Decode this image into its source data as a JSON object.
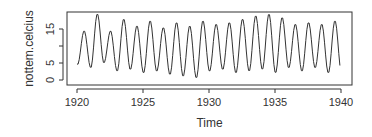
{
  "chart_data": {
    "type": "line",
    "title": "",
    "xlabel": "Time",
    "ylabel": "nottem.celcius",
    "xlim": [
      1919.5,
      1940.3
    ],
    "ylim": [
      -0.8,
      21.5
    ],
    "x_ticks": [
      1920,
      1925,
      1930,
      1935,
      1940
    ],
    "x_tick_labels": [
      "1920",
      "1925",
      "1930",
      "1935",
      "1940"
    ],
    "y_ticks": [
      0,
      5,
      10,
      15
    ],
    "y_tick_labels": [
      "0",
      "5",
      "10",
      "15"
    ],
    "grid": false,
    "legend": null,
    "line_color": "#333333",
    "series_note": "Approximate seasonal extrema read from the rendered line; not exact monthly values. The plotted polyline is a smooth seasonal interpolation of these extrema, not the original monthly series.",
    "annual_extrema_approx": [
      {
        "year": 1920,
        "peak": 14.5,
        "trough": 4.5
      },
      {
        "year": 1921,
        "peak": 19.5,
        "trough": 3.5
      },
      {
        "year": 1922,
        "peak": 14.5,
        "trough": 5.0
      },
      {
        "year": 1923,
        "peak": 18.0,
        "trough": 2.5
      },
      {
        "year": 1924,
        "peak": 16.0,
        "trough": 3.0
      },
      {
        "year": 1925,
        "peak": 17.5,
        "trough": 2.0
      },
      {
        "year": 1926,
        "peak": 15.5,
        "trough": 2.5
      },
      {
        "year": 1927,
        "peak": 17.0,
        "trough": 1.5
      },
      {
        "year": 1928,
        "peak": 16.0,
        "trough": 1.0
      },
      {
        "year": 1929,
        "peak": 17.5,
        "trough": 0.5
      },
      {
        "year": 1930,
        "peak": 16.5,
        "trough": 2.5
      },
      {
        "year": 1931,
        "peak": 17.0,
        "trough": 3.0
      },
      {
        "year": 1932,
        "peak": 18.0,
        "trough": 2.0
      },
      {
        "year": 1933,
        "peak": 19.0,
        "trough": 2.5
      },
      {
        "year": 1934,
        "peak": 19.5,
        "trough": 3.0
      },
      {
        "year": 1935,
        "peak": 18.5,
        "trough": 2.0
      },
      {
        "year": 1936,
        "peak": 16.5,
        "trough": 3.5
      },
      {
        "year": 1937,
        "peak": 17.0,
        "trough": 2.5
      },
      {
        "year": 1938,
        "peak": 16.5,
        "trough": 3.5
      },
      {
        "year": 1939,
        "peak": 17.5,
        "trough": 2.0
      }
    ],
    "series_start": 1920.0,
    "series_end": 1939.92,
    "frequency": 12
  },
  "layout": {
    "plot_box": {
      "left": 67,
      "right": 352,
      "top": 12,
      "bottom": 85
    }
  }
}
